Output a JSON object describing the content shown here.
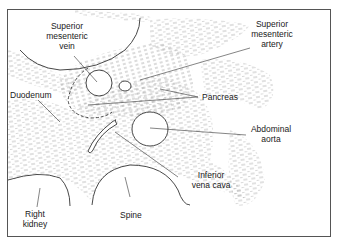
{
  "diagram": {
    "type": "anatomical cross-section (ultrasound/CT schematic)",
    "labels": {
      "superior_mesenteric_vein": [
        "Superior",
        "mesenteric",
        "vein"
      ],
      "superior_mesenteric_artery": [
        "Superior",
        "mesenteric",
        "artery"
      ],
      "duodenum": "Duodenum",
      "pancreas": "Pancreas",
      "abdominal_aorta": [
        "Abdominal",
        "aorta"
      ],
      "inferior_vena_cava": [
        "Inferior",
        "vena cava"
      ],
      "spine": "Spine",
      "right_kidney": [
        "Right",
        "kidney"
      ]
    },
    "colors": {
      "line": "#333333",
      "hatch": "#9a9a9a",
      "background": "#ffffff",
      "border": "#555555"
    }
  }
}
